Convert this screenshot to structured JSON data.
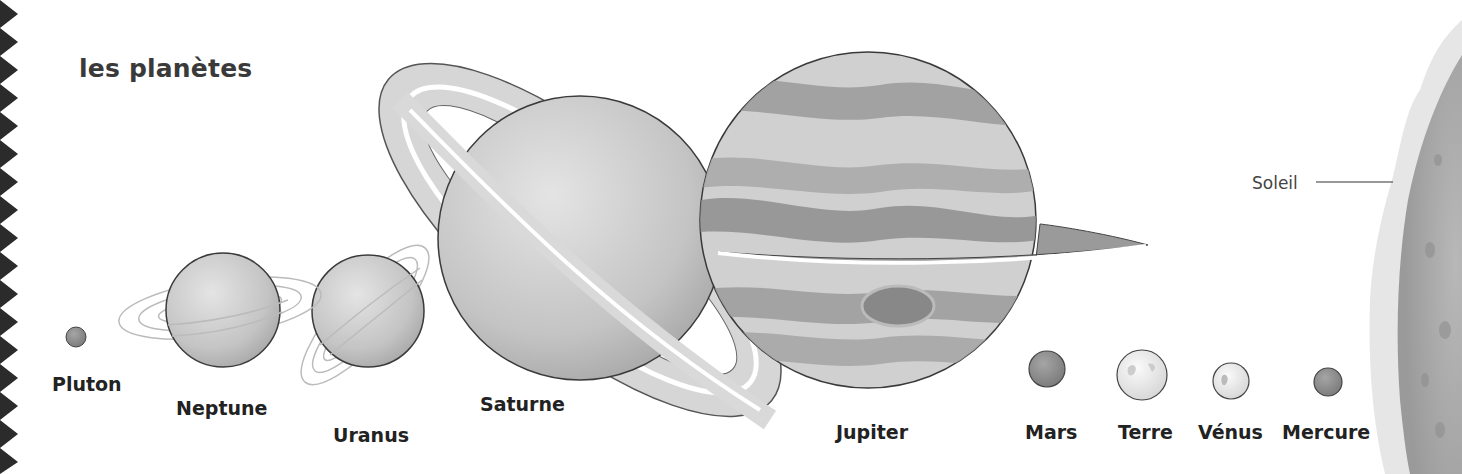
{
  "title": "les planètes",
  "sun": {
    "label": "Soleil"
  },
  "planets": [
    {
      "name": "Pluton"
    },
    {
      "name": "Neptune"
    },
    {
      "name": "Uranus"
    },
    {
      "name": "Saturne"
    },
    {
      "name": "Jupiter"
    },
    {
      "name": "Mars"
    },
    {
      "name": "Terre"
    },
    {
      "name": "Vénus"
    },
    {
      "name": "Mercure"
    }
  ],
  "colors": {
    "outline": "#3a3a3a",
    "planet_fill": "#c8c8c8",
    "sun_fill": "#a9a9a9",
    "zigzag": "#2b2b2b"
  }
}
